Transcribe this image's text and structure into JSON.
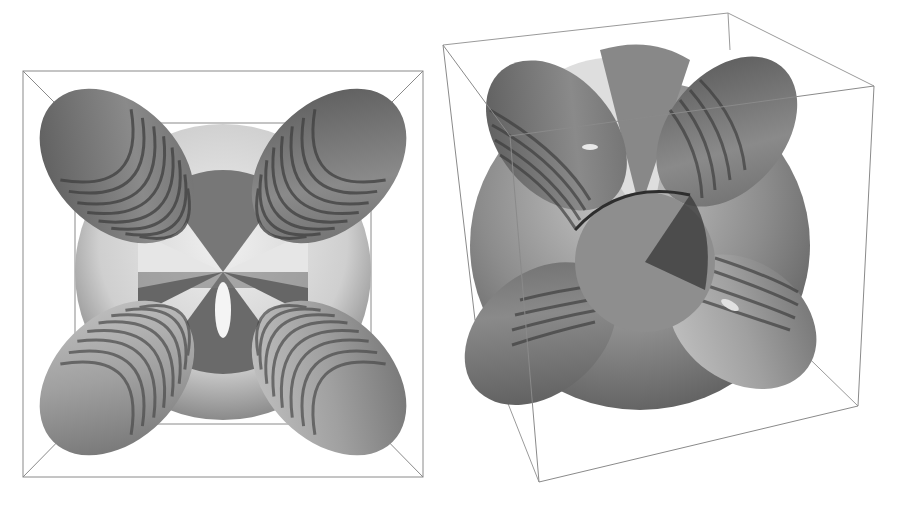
{
  "figure": {
    "panels": [
      {
        "name": "top-view",
        "view": "orthographic top-down"
      },
      {
        "name": "perspective-view",
        "view": "oblique perspective"
      }
    ],
    "colors": {
      "background": "#ffffff",
      "box_line": "#8a8a8a",
      "surface_dark": "#5a5a5a",
      "surface_mid": "#8c8c8c",
      "surface_light": "#dcdcdc",
      "highlight": "#f2f2f2"
    }
  }
}
